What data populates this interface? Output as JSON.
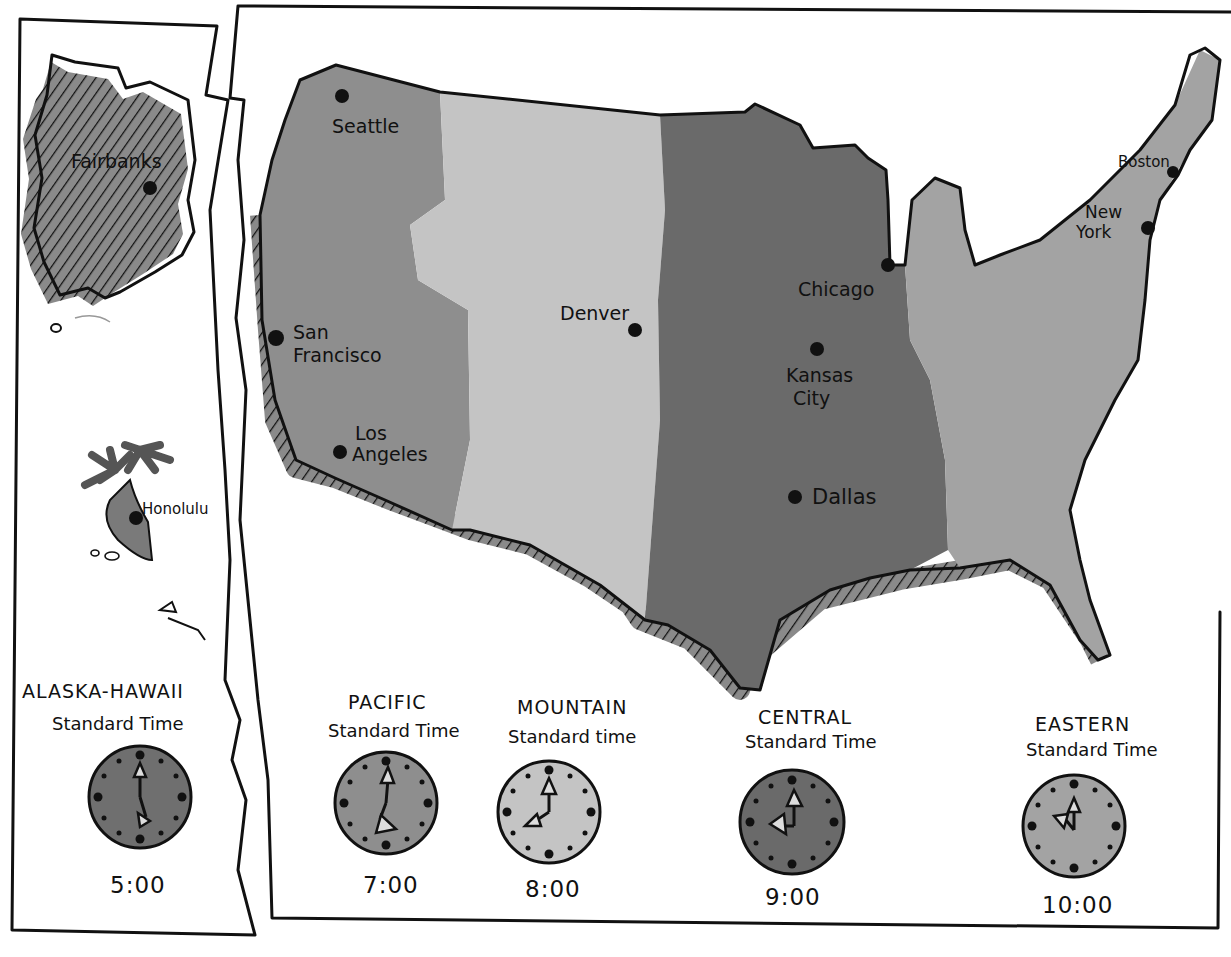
{
  "map": {
    "cities": {
      "fairbanks": "Fairbanks",
      "honolulu": "Honolulu",
      "seattle": "Seattle",
      "san_francisco_1": "San",
      "san_francisco_2": "Francisco",
      "los_angeles_1": "Los",
      "los_angeles_2": "Angeles",
      "denver": "Denver",
      "chicago": "Chicago",
      "kansas_city_1": "Kansas",
      "kansas_city_2": "City",
      "dallas": "Dallas",
      "boston": "Boston",
      "new_york_1": "New",
      "new_york_2": "York"
    },
    "zone_colors": {
      "alaska_hawaii": "#6f6f6f",
      "pacific": "#8e8e8e",
      "mountain": "#c4c4c4",
      "central": "#6a6a6a",
      "eastern": "#a3a3a3"
    }
  },
  "zones": [
    {
      "name": "ALASKA-HAWAII",
      "subtitle": "Standard Time",
      "time": "5:00"
    },
    {
      "name": "PACIFIC",
      "subtitle": "Standard Time",
      "time": "7:00"
    },
    {
      "name": "MOUNTAIN",
      "subtitle": "Standard time",
      "time": "8:00"
    },
    {
      "name": "CENTRAL",
      "subtitle": "Standard Time",
      "time": "9:00"
    },
    {
      "name": "EASTERN",
      "subtitle": "Standard Time",
      "time": "10:00"
    }
  ]
}
